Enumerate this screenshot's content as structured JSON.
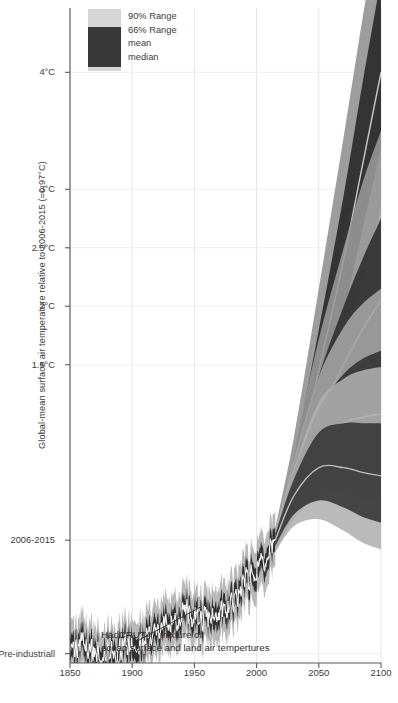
{
  "chart_data": {
    "type": "area",
    "title": "",
    "xlabel": "",
    "ylabel": "Global-mean surface air temperature relative to 2006-2015 (=0.97°C)",
    "xlim": [
      1850,
      2100
    ],
    "ylim": [
      -1.05,
      4.55
    ],
    "grid": true,
    "legend_position": "top-left",
    "x_ticks": [
      1850,
      1900,
      1950,
      2000,
      2050,
      2100
    ],
    "x_tick_labels": [
      "1850",
      "1900",
      "1950",
      "2000",
      "2050",
      "2100"
    ],
    "y_ticks": [
      4,
      3,
      2.5,
      2,
      1.5,
      0,
      -0.97
    ],
    "y_tick_labels": [
      "4°C",
      "3°C",
      "2.5°C",
      "2°C",
      "1.5°C",
      "2006-2015",
      "Pre-industriall"
    ],
    "legend": [
      {
        "label": "90% Range",
        "color": "#d6d6d6"
      },
      {
        "label": "66% Range",
        "color": "#383838"
      },
      {
        "label": "mean",
        "color": "#e8e8e8"
      },
      {
        "label": "median",
        "color": "#b9b9b9"
      }
    ],
    "annotations": [
      {
        "line1": "HadCRUT4 - mixture of",
        "line2": "ocean surface and land air tempertures",
        "x": 1875,
        "y": -0.83,
        "pointer_x": 1955,
        "pointer_y": -0.52
      }
    ],
    "series": [
      {
        "name": "HadCRUT4 observations",
        "kind": "historical",
        "color_band90": "#b4b4b4",
        "color_band66": "#2e2e2e",
        "color_mean": "#f2f2f2",
        "x": [
          1850,
          1855,
          1860,
          1865,
          1870,
          1875,
          1880,
          1885,
          1890,
          1895,
          1900,
          1905,
          1910,
          1915,
          1920,
          1925,
          1930,
          1935,
          1940,
          1945,
          1950,
          1955,
          1960,
          1965,
          1970,
          1975,
          1980,
          1985,
          1990,
          1995,
          2000,
          2005,
          2010,
          2015
        ],
        "mean": [
          -0.92,
          -0.95,
          -0.9,
          -0.93,
          -0.96,
          -0.97,
          -0.93,
          -0.95,
          -0.94,
          -0.9,
          -0.87,
          -0.9,
          -0.88,
          -0.8,
          -0.78,
          -0.75,
          -0.7,
          -0.7,
          -0.6,
          -0.62,
          -0.68,
          -0.68,
          -0.66,
          -0.68,
          -0.62,
          -0.62,
          -0.5,
          -0.5,
          -0.36,
          -0.32,
          -0.26,
          -0.16,
          -0.1,
          0.0
        ],
        "band66_low": [
          -1.02,
          -1.05,
          -1.0,
          -1.03,
          -1.06,
          -1.07,
          -1.03,
          -1.05,
          -1.04,
          -1.0,
          -0.97,
          -1.0,
          -0.98,
          -0.9,
          -0.88,
          -0.85,
          -0.8,
          -0.8,
          -0.7,
          -0.72,
          -0.78,
          -0.78,
          -0.76,
          -0.78,
          -0.72,
          -0.72,
          -0.6,
          -0.6,
          -0.46,
          -0.42,
          -0.36,
          -0.26,
          -0.2,
          -0.1
        ],
        "band66_high": [
          -0.82,
          -0.85,
          -0.8,
          -0.83,
          -0.86,
          -0.87,
          -0.83,
          -0.85,
          -0.84,
          -0.8,
          -0.77,
          -0.8,
          -0.78,
          -0.7,
          -0.68,
          -0.65,
          -0.6,
          -0.6,
          -0.5,
          -0.52,
          -0.58,
          -0.58,
          -0.56,
          -0.58,
          -0.52,
          -0.52,
          -0.4,
          -0.4,
          -0.26,
          -0.22,
          -0.16,
          -0.06,
          0.0,
          0.1
        ]
      },
      {
        "name": "Scenario fan A (highest)",
        "kind": "projection",
        "color_band90": "#8f8f8f",
        "color_band66": "#2b2b2b",
        "color_median": "#c9c9c9",
        "x": [
          2015,
          2030,
          2050,
          2070,
          2085,
          2100
        ],
        "median": [
          0.0,
          0.55,
          1.45,
          2.4,
          3.2,
          4.0
        ],
        "band66_low": [
          -0.05,
          0.4,
          1.15,
          1.95,
          2.65,
          3.35
        ],
        "band66_high": [
          0.05,
          0.72,
          1.8,
          2.95,
          3.9,
          4.8
        ],
        "band90_low": [
          -0.1,
          0.28,
          0.9,
          1.6,
          2.2,
          2.85
        ],
        "band90_high": [
          0.1,
          0.88,
          2.15,
          3.45,
          4.45,
          5.4
        ]
      },
      {
        "name": "Scenario fan B",
        "kind": "projection",
        "color_band90": "#9a9a9a",
        "color_band66": "#313131",
        "color_median": "#c4c4c4",
        "x": [
          2015,
          2030,
          2050,
          2070,
          2085,
          2100
        ],
        "median": [
          0.0,
          0.48,
          1.05,
          1.5,
          1.8,
          2.05
        ],
        "band66_low": [
          -0.05,
          0.32,
          0.72,
          1.05,
          1.25,
          1.42
        ],
        "band66_high": [
          0.05,
          0.64,
          1.4,
          2.0,
          2.4,
          2.75
        ],
        "band90_low": [
          -0.1,
          0.22,
          0.52,
          0.78,
          0.92,
          1.02
        ],
        "band90_high": [
          0.1,
          0.78,
          1.72,
          2.5,
          3.05,
          3.5
        ]
      },
      {
        "name": "Scenario fan C",
        "kind": "projection",
        "color_band90": "#a5a5a5",
        "color_band66": "#353535",
        "color_median": "#c0c0c0",
        "x": [
          2015,
          2030,
          2050,
          2070,
          2085,
          2100
        ],
        "median": [
          0.0,
          0.42,
          0.82,
          1.0,
          1.05,
          1.08
        ],
        "band66_low": [
          -0.05,
          0.28,
          0.55,
          0.62,
          0.6,
          0.58
        ],
        "band66_high": [
          0.05,
          0.58,
          1.12,
          1.42,
          1.55,
          1.62
        ],
        "band90_low": [
          -0.1,
          0.18,
          0.38,
          0.4,
          0.36,
          0.32
        ],
        "band90_high": [
          0.1,
          0.7,
          1.4,
          1.82,
          2.02,
          2.15
        ]
      },
      {
        "name": "Scenario fan D (lowest)",
        "kind": "projection",
        "color_band90": "#b0b0b0",
        "color_band66": "#3a3a3a",
        "color_median": "#bdbdbd",
        "x": [
          2015,
          2030,
          2050,
          2070,
          2085,
          2100
        ],
        "median": [
          0.0,
          0.38,
          0.62,
          0.62,
          0.58,
          0.55
        ],
        "band66_low": [
          -0.05,
          0.22,
          0.34,
          0.28,
          0.2,
          0.15
        ],
        "band66_high": [
          0.05,
          0.52,
          0.92,
          1.0,
          1.0,
          1.0
        ],
        "band90_low": [
          -0.1,
          0.12,
          0.18,
          0.08,
          -0.02,
          -0.08
        ],
        "band90_high": [
          0.1,
          0.62,
          1.18,
          1.38,
          1.45,
          1.48
        ]
      }
    ]
  }
}
